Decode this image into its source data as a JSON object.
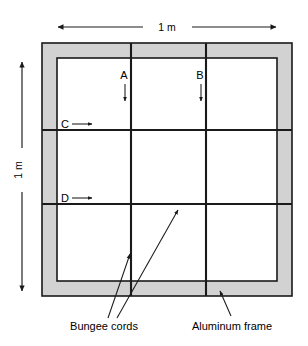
{
  "figure": {
    "dimensions": {
      "top_label": "1 m",
      "left_label": "1 m"
    },
    "node_labels": {
      "a": "A",
      "b": "B",
      "c": "C",
      "d": "D"
    },
    "captions": {
      "bungee": "Bungee cords",
      "frame": "Aluminum frame"
    },
    "colors": {
      "frame_fill": "#d2d2d2",
      "line": "#1a1a1a",
      "background": "#ffffff",
      "interior_fill": "#ffffff"
    },
    "geometry": {
      "frame_outer": {
        "x": 42,
        "y": 43,
        "width": 250,
        "height": 253
      },
      "frame_inner": {
        "x": 57,
        "y": 58,
        "width": 220,
        "height": 223
      },
      "vertical_cords_x": [
        131,
        206
      ],
      "horizontal_cords_y": [
        130,
        204
      ],
      "top_dimension": {
        "x1": 58,
        "x2": 276,
        "y": 27
      },
      "left_dimension": {
        "y1": 62,
        "y2": 291,
        "x": 22
      }
    }
  }
}
